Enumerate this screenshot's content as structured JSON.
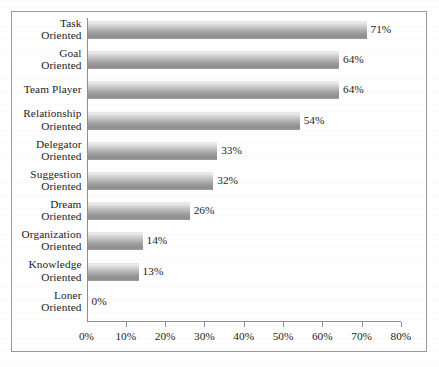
{
  "chart_data": {
    "type": "bar",
    "orientation": "horizontal",
    "title": "",
    "subtitle": "",
    "xlabel": "",
    "ylabel": "",
    "categories": [
      "Task\nOriented",
      "Goal\nOriented",
      "Team Player",
      "Relationship\nOriented",
      "Delegator\nOriented",
      "Suggestion\nOriented",
      "Dream\nOriented",
      "Organization\nOriented",
      "Knowledge\nOriented",
      "Loner\nOriented"
    ],
    "values": [
      71,
      64,
      64,
      54,
      33,
      32,
      26,
      14,
      13,
      0
    ],
    "value_labels": [
      "71%",
      "64%",
      "64%",
      "54%",
      "33%",
      "32%",
      "26%",
      "14%",
      "13%",
      "0%"
    ],
    "xlim": [
      0,
      80
    ],
    "xticks": [
      0,
      10,
      20,
      30,
      40,
      50,
      60,
      70,
      80
    ],
    "xtick_labels": [
      "0%",
      "10%",
      "20%",
      "30%",
      "40%",
      "50%",
      "60%",
      "70%",
      "80%"
    ],
    "grid": false,
    "legend": null,
    "bar_color_top": "#dadada",
    "bar_color_bottom": "#8d8d8d",
    "axis_color": "#8e8e8e",
    "frame_color": "#9a9a9a",
    "text_color": "#1d1d1d",
    "background_color": "#fefefe"
  }
}
